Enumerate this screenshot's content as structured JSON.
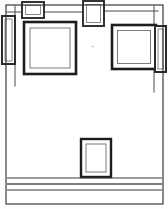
{
  "document": {
    "kind": "line-drawing",
    "subject": "interior wall elevation with framed panels",
    "background_color": "#ffffff",
    "ink_color": "#1d1d1d",
    "mid_ink_color": "#6a6a6a",
    "light_ink_color": "#9a9a9a",
    "width": 168,
    "height": 209
  },
  "annotation": {
    "tick_label": "•",
    "tick_x": 92,
    "tick_y": 45
  },
  "sheet_border": {
    "name": "outer-sheet-border",
    "x": 6,
    "y": 5,
    "width": 157,
    "height": 199,
    "stroke": "#2a2a2a",
    "stroke_width": 1.1
  },
  "wall_field": {
    "name": "wall-field",
    "x": 7,
    "y": 6,
    "width": 155,
    "height": 197,
    "fill": "#ffffff"
  },
  "panels": [
    {
      "id": "panel-left-edge-tall",
      "label": "narrow tall panel, left edge",
      "shape": "rect",
      "x": 2,
      "y": 16,
      "width": 13,
      "height": 48,
      "outer_stroke": "#2b2b2b",
      "outer_width": 2.0,
      "inner_inset": 3,
      "inner_stroke": "#6d6d6d",
      "inner_width": 0.8
    },
    {
      "id": "panel-top-small-left",
      "label": "small square frame, top left",
      "shape": "rect",
      "x": 22,
      "y": 2,
      "width": 22,
      "height": 16,
      "outer_stroke": "#2b2b2b",
      "outer_width": 1.9,
      "inner_inset": 3.5,
      "inner_stroke": "#6d6d6d",
      "inner_width": 0.8
    },
    {
      "id": "panel-top-small-center",
      "label": "small square frame, top center",
      "shape": "rect",
      "x": 83,
      "y": 1,
      "width": 21,
      "height": 25,
      "outer_stroke": "#2b2b2b",
      "outer_width": 1.9,
      "inner_inset": 3.5,
      "inner_stroke": "#6d6d6d",
      "inner_width": 0.8
    },
    {
      "id": "panel-large-left",
      "label": "large square frame, left",
      "shape": "rect",
      "x": 24,
      "y": 22,
      "width": 52,
      "height": 52,
      "outer_stroke": "#1d1d1d",
      "outer_width": 2.6,
      "inner_inset": 6,
      "inner_stroke": "#6d6d6d",
      "inner_width": 0.9
    },
    {
      "id": "panel-large-right",
      "label": "large square frame, right",
      "shape": "rect",
      "x": 112,
      "y": 25,
      "width": 44,
      "height": 44,
      "outer_stroke": "#1d1d1d",
      "outer_width": 2.6,
      "inner_inset": 5.5,
      "inner_stroke": "#6d6d6d",
      "inner_width": 0.9
    },
    {
      "id": "panel-right-edge-tall",
      "label": "narrow tall panel, right edge",
      "shape": "rect",
      "x": 155,
      "y": 26,
      "width": 11,
      "height": 46,
      "outer_stroke": "#2b2b2b",
      "outer_width": 2.0,
      "inner_inset": 3,
      "inner_stroke": "#6d6d6d",
      "inner_width": 0.8
    },
    {
      "id": "panel-bottom-center",
      "label": "portrait frame, lower center",
      "shape": "rect",
      "x": 81,
      "y": 139,
      "width": 30,
      "height": 38,
      "outer_stroke": "#1d1d1d",
      "outer_width": 2.4,
      "inner_inset": 5,
      "inner_stroke": "#6d6d6d",
      "inner_width": 0.9
    }
  ],
  "bands": [
    {
      "id": "band-upper-rail",
      "label": "upper horizontal rail",
      "x1": 7,
      "x2": 162,
      "y": 178,
      "stroke": "#3a3a3a",
      "stroke_width": 1.2
    },
    {
      "id": "band-mid-rail",
      "label": "middle horizontal rail",
      "x1": 7,
      "x2": 162,
      "y": 184,
      "stroke": "#555555",
      "stroke_width": 1.6
    },
    {
      "id": "band-lower-rail",
      "label": "lower horizontal rail",
      "x1": 7,
      "x2": 162,
      "y": 190,
      "stroke": "#3a3a3a",
      "stroke_width": 1.2
    }
  ],
  "wall_edges": [
    {
      "id": "wall-edge-left-return",
      "label": "left wall return line",
      "x1": 15,
      "y1": 6,
      "x2": 15,
      "y2": 86,
      "stroke": "#4a4a4a",
      "stroke_width": 1.0
    },
    {
      "id": "wall-edge-right-return",
      "label": "right wall return line",
      "x1": 154,
      "y1": 6,
      "x2": 154,
      "y2": 92,
      "stroke": "#4a4a4a",
      "stroke_width": 1.0
    },
    {
      "id": "wall-edge-top-left",
      "label": "top left soffit line",
      "x1": 7,
      "y1": 12,
      "x2": 22,
      "y2": 12,
      "stroke": "#4a4a4a",
      "stroke_width": 1.0
    },
    {
      "id": "wall-edge-top-right",
      "label": "top right soffit line",
      "x1": 104,
      "y1": 11,
      "x2": 158,
      "y2": 11,
      "stroke": "#4a4a4a",
      "stroke_width": 1.0
    },
    {
      "id": "wall-edge-top-mid",
      "label": "top middle soffit line",
      "x1": 44,
      "y1": 12,
      "x2": 83,
      "y2": 12,
      "stroke": "#4a4a4a",
      "stroke_width": 1.0
    }
  ]
}
